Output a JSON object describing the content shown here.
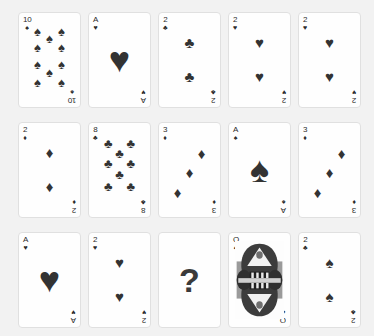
{
  "view": {
    "background_color": "#f2f2f2",
    "card_face_color": "#fefefe",
    "card_border_color": "#e0e0e0",
    "pip_color": "#333333",
    "index_color": "#2b2b2b",
    "columns": 5,
    "rows": 3,
    "card_count": 15
  },
  "glyphs": {
    "spade": "♠",
    "heart": "♥",
    "diamond": "♦",
    "club": "♣",
    "question": "?"
  },
  "cards": [
    {
      "position": "row1-col1",
      "rank": "10",
      "pip_suit": "spade",
      "index_suit": "spade",
      "index_rank": "10",
      "pip_layout": "ten",
      "pip_count": 10,
      "face_card": false
    },
    {
      "position": "row1-col2",
      "rank": "A",
      "pip_suit": "heart",
      "index_suit": "heart",
      "index_rank": "A",
      "pip_layout": "ace",
      "pip_count": 1,
      "face_card": false
    },
    {
      "position": "row1-col3",
      "rank": "2",
      "pip_suit": "club",
      "index_suit": "club",
      "index_rank": "2",
      "pip_layout": "two",
      "pip_count": 2,
      "face_card": false
    },
    {
      "position": "row1-col4",
      "rank": "2",
      "pip_suit": "heart",
      "index_suit": "heart",
      "index_rank": "2",
      "pip_layout": "two",
      "pip_count": 2,
      "face_card": false
    },
    {
      "position": "row1-col5",
      "rank": "2",
      "pip_suit": "heart",
      "index_suit": "heart",
      "index_rank": "2",
      "pip_layout": "two",
      "pip_count": 2,
      "face_card": false
    },
    {
      "position": "row2-col1",
      "rank": "2",
      "pip_suit": "diamond",
      "index_suit": "diamond",
      "index_rank": "2",
      "pip_layout": "two",
      "pip_count": 2,
      "face_card": false
    },
    {
      "position": "row2-col2",
      "rank": "8",
      "pip_suit": "club",
      "index_suit": "club",
      "index_rank": "8",
      "pip_layout": "eight",
      "pip_count": 8,
      "face_card": false
    },
    {
      "position": "row2-col3",
      "rank": "3",
      "pip_suit": "diamond",
      "index_suit": "diamond",
      "index_rank": "3",
      "pip_layout": "three-diagonal",
      "pip_count": 3,
      "face_card": false
    },
    {
      "position": "row2-col4",
      "rank": "A",
      "pip_suit": "spade",
      "index_suit": "spade",
      "index_rank": "A",
      "pip_layout": "ace",
      "pip_count": 1,
      "face_card": false
    },
    {
      "position": "row2-col5",
      "rank": "3",
      "pip_suit": "diamond",
      "index_suit": "diamond",
      "index_rank": "3",
      "pip_layout": "three-diagonal",
      "pip_count": 3,
      "face_card": false
    },
    {
      "position": "row3-col1",
      "rank": "A",
      "pip_suit": "heart",
      "index_suit": "heart",
      "index_rank": "A",
      "pip_layout": "ace",
      "pip_count": 1,
      "face_card": false
    },
    {
      "position": "row3-col2",
      "rank": "2",
      "pip_suit": "heart",
      "index_suit": "heart",
      "index_rank": "2",
      "pip_layout": "two",
      "pip_count": 2,
      "face_card": false
    },
    {
      "position": "row3-col3",
      "rank": "?",
      "pip_suit": "",
      "index_suit": "",
      "index_rank": "",
      "pip_layout": "unknown",
      "pip_count": 0,
      "face_card": false
    },
    {
      "position": "row3-col4",
      "rank": "Q",
      "pip_suit": "club",
      "index_suit": "club",
      "index_rank": "Q",
      "pip_layout": "court",
      "pip_count": 0,
      "face_card": true
    },
    {
      "position": "row3-col5",
      "rank": "2",
      "pip_suit": "spade",
      "index_suit": "club",
      "index_rank": "2",
      "pip_layout": "two",
      "pip_count": 2,
      "face_card": false
    }
  ]
}
